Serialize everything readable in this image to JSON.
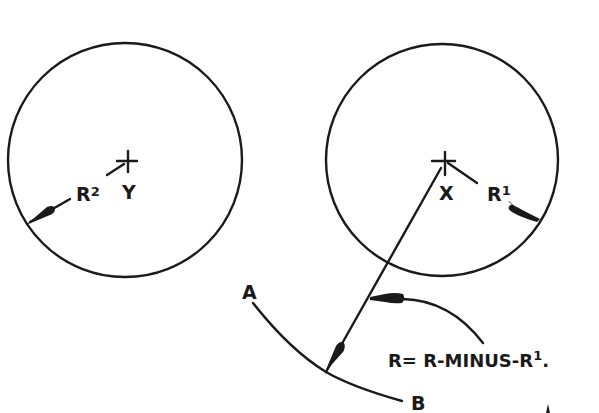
{
  "diagram": {
    "type": "geometric construction",
    "circles": [
      {
        "id": "left",
        "center_label": "Y",
        "radius_label": "R",
        "radius_sup": "2",
        "cx": 125,
        "cy": 160,
        "r": 117
      },
      {
        "id": "right",
        "center_label": "X",
        "radius_label": "R",
        "radius_sup": "1",
        "cx": 442,
        "cy": 160,
        "r": 116
      }
    ],
    "arc": {
      "start_label": "A",
      "end_label": "B"
    },
    "formula": {
      "prefix": "R= R-MINUS-R",
      "sup": "1",
      "suffix": "."
    },
    "colors": {
      "ink": "#1a1a1a",
      "background": "#ffffff"
    }
  }
}
